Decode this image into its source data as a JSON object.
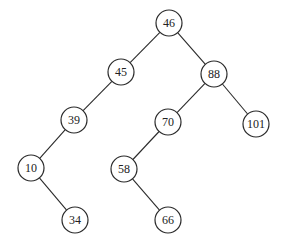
{
  "diagram": {
    "type": "binary-search-tree",
    "node_radius": 13,
    "colors": {
      "stroke": "#2a2a2a",
      "fill": "#ffffff",
      "text": "#222222",
      "background": "#ffffff"
    },
    "nodes": [
      {
        "id": "n46",
        "label": "46",
        "x": 169,
        "y": 23
      },
      {
        "id": "n45",
        "label": "45",
        "x": 121,
        "y": 72
      },
      {
        "id": "n88",
        "label": "88",
        "x": 214,
        "y": 74
      },
      {
        "id": "n39",
        "label": "39",
        "x": 74,
        "y": 120
      },
      {
        "id": "n70",
        "label": "70",
        "x": 168,
        "y": 122
      },
      {
        "id": "n101",
        "label": "101",
        "x": 256,
        "y": 124
      },
      {
        "id": "n10",
        "label": "10",
        "x": 31,
        "y": 168
      },
      {
        "id": "n58",
        "label": "58",
        "x": 124,
        "y": 169
      },
      {
        "id": "n34",
        "label": "34",
        "x": 75,
        "y": 220
      },
      {
        "id": "n66",
        "label": "66",
        "x": 168,
        "y": 220
      }
    ],
    "edges": [
      {
        "from": "n46",
        "to": "n45",
        "side": "left"
      },
      {
        "from": "n46",
        "to": "n88",
        "side": "right"
      },
      {
        "from": "n45",
        "to": "n39",
        "side": "left"
      },
      {
        "from": "n88",
        "to": "n70",
        "side": "left"
      },
      {
        "from": "n88",
        "to": "n101",
        "side": "right"
      },
      {
        "from": "n39",
        "to": "n10",
        "side": "left"
      },
      {
        "from": "n70",
        "to": "n58",
        "side": "left"
      },
      {
        "from": "n10",
        "to": "n34",
        "side": "right"
      },
      {
        "from": "n58",
        "to": "n66",
        "side": "right"
      }
    ]
  }
}
